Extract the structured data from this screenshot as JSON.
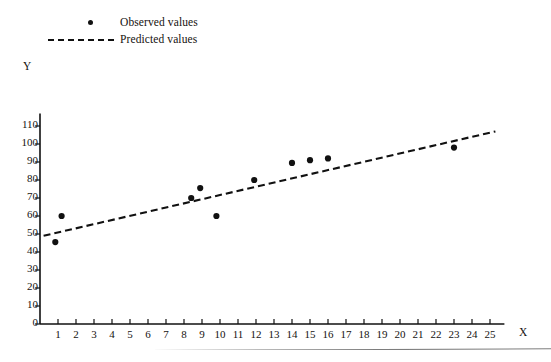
{
  "figure": {
    "background": "#ffffff",
    "ink_color": "#111111"
  },
  "legend": {
    "position": "top-left",
    "entries": [
      {
        "label": "Observed values",
        "marker": "dot",
        "icon": "scatter-dot-icon"
      },
      {
        "label": "Predicted values",
        "marker": "dashed-line",
        "icon": "dashed-line-icon"
      }
    ]
  },
  "axes": {
    "y_name": "Y",
    "x_name": "X"
  },
  "chart_data": {
    "type": "scatter",
    "title": "",
    "subtitle": "",
    "xlabel": "X",
    "ylabel": "Y",
    "xlim": [
      0,
      25.8
    ],
    "ylim": [
      0,
      117
    ],
    "grid": false,
    "legend_position": "top-left",
    "x_ticks": [
      1,
      2,
      3,
      4,
      5,
      6,
      7,
      8,
      9,
      10,
      11,
      12,
      13,
      14,
      15,
      16,
      17,
      18,
      19,
      20,
      21,
      22,
      23,
      24,
      25
    ],
    "y_ticks": [
      0,
      10,
      20,
      30,
      40,
      50,
      60,
      70,
      80,
      90,
      100,
      110
    ],
    "series": [
      {
        "name": "Observed values",
        "type": "scatter",
        "marker": "dot",
        "color": "#111111",
        "points": [
          {
            "x": 0.85,
            "y": 45.5
          },
          {
            "x": 1.2,
            "y": 60.0
          },
          {
            "x": 8.4,
            "y": 70.0
          },
          {
            "x": 8.9,
            "y": 75.5
          },
          {
            "x": 9.8,
            "y": 60.0
          },
          {
            "x": 11.9,
            "y": 80.0
          },
          {
            "x": 14.0,
            "y": 89.5
          },
          {
            "x": 15.0,
            "y": 91.0
          },
          {
            "x": 16.0,
            "y": 92.0
          },
          {
            "x": 23.0,
            "y": 98.0
          }
        ]
      },
      {
        "name": "Predicted values",
        "type": "line",
        "style": "dashed",
        "color": "#111111",
        "points": [
          {
            "x": 0.2,
            "y": 49.0
          },
          {
            "x": 25.3,
            "y": 107.0
          }
        ]
      }
    ]
  }
}
